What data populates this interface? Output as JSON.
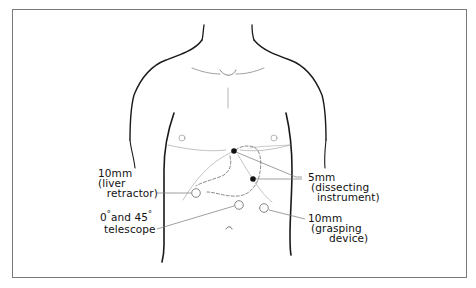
{
  "figure": {
    "type": "anatomical-illustration",
    "frame_color": "#7a7a7a",
    "line_color": "#1a1a1a"
  },
  "ports": [
    {
      "id": "liver-retractor",
      "size": "10mm",
      "role": "(liver",
      "role2": "retractor)",
      "marker": "open-circle",
      "x": 196,
      "y": 193
    },
    {
      "id": "telescope",
      "size": "0° and 45°",
      "role": "telescope",
      "marker": "open-circle",
      "x": 239,
      "y": 205
    },
    {
      "id": "grasping",
      "size": "10mm",
      "role": "(grasping",
      "role2": "device)",
      "marker": "open-circle",
      "x": 264,
      "y": 208
    },
    {
      "id": "dissecting-upper",
      "size": "5mm",
      "role": "(dissecting",
      "role2": "instrument)",
      "marker": "filled-dot",
      "x": 234,
      "y": 151
    },
    {
      "id": "dissecting-lower",
      "size": "5mm",
      "role": "(dissecting",
      "role2": "instrument)",
      "marker": "filled-dot",
      "x": 253,
      "y": 179
    }
  ],
  "labels": {
    "liver": {
      "line1": "10mm",
      "line2": "(liver",
      "line3": "retractor)"
    },
    "telescope": {
      "line1a": "0",
      "line1b": "and 45",
      "deg": "°",
      "line2": "telescope"
    },
    "dissecting": {
      "line1": "5mm",
      "line2": "(dissecting",
      "line3": "instrument)"
    },
    "grasping": {
      "line1": "10mm",
      "line2": "(grasping",
      "line3": "device)"
    }
  }
}
